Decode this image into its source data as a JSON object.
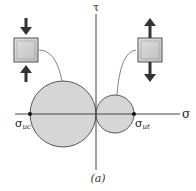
{
  "diagram": {
    "type": "mohr-circle",
    "axes": {
      "horizontal_label": "σ",
      "vertical_label": "τ"
    },
    "points": [
      {
        "label_main": "σ",
        "label_sub": "uc",
        "meaning": "ultimate compressive strength"
      },
      {
        "label_main": "σ",
        "label_sub": "ut",
        "meaning": "ultimate tensile strength"
      }
    ],
    "circles": [
      {
        "name": "compression-circle",
        "fill": "#d6d6d6"
      },
      {
        "name": "tension-circle",
        "fill": "#d6d6d6"
      }
    ],
    "elements": [
      {
        "name": "compression-element",
        "loading": "compressive"
      },
      {
        "name": "tension-element",
        "loading": "tensile"
      }
    ],
    "caption": "(a)",
    "colors": {
      "circle_fill": "#d6d6d6",
      "outline": "#555555",
      "arrow": "#333333",
      "box_fill": "#c8c8c8"
    }
  }
}
